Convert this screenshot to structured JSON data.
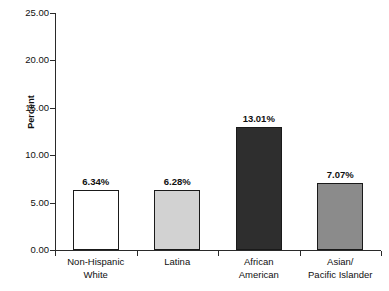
{
  "chart_data": {
    "type": "bar",
    "title": "",
    "subtitle": "",
    "xlabel": "",
    "ylabel": "Percent",
    "ylim": [
      0,
      25
    ],
    "yticks": [
      0,
      5,
      10,
      15,
      20,
      25
    ],
    "ytick_labels": [
      "0.00",
      "5.00",
      "10.00",
      "15.00",
      "20.00",
      "25.00"
    ],
    "grid": false,
    "legend": "none",
    "categories": [
      "Non-Hispanic White",
      "Latina",
      "African American",
      "Asian/ Pacific Islander"
    ],
    "category_lines": [
      [
        "Non-Hispanic",
        "White"
      ],
      [
        "Latina",
        ""
      ],
      [
        "African",
        "American"
      ],
      [
        "Asian/",
        "Pacific Islander"
      ]
    ],
    "values": [
      6.34,
      6.28,
      13.01,
      7.07
    ],
    "value_labels": [
      "6.34%",
      "6.28%",
      "13.01%",
      "7.07%"
    ],
    "bar_colors": [
      "#ffffff",
      "#d2d2d2",
      "#2e2e2e",
      "#8b8b8b"
    ],
    "bar_border_color": "#1a1a1a",
    "axis_color": "#2a2a2a",
    "text_color": "#101010",
    "background": "#ffffff"
  }
}
